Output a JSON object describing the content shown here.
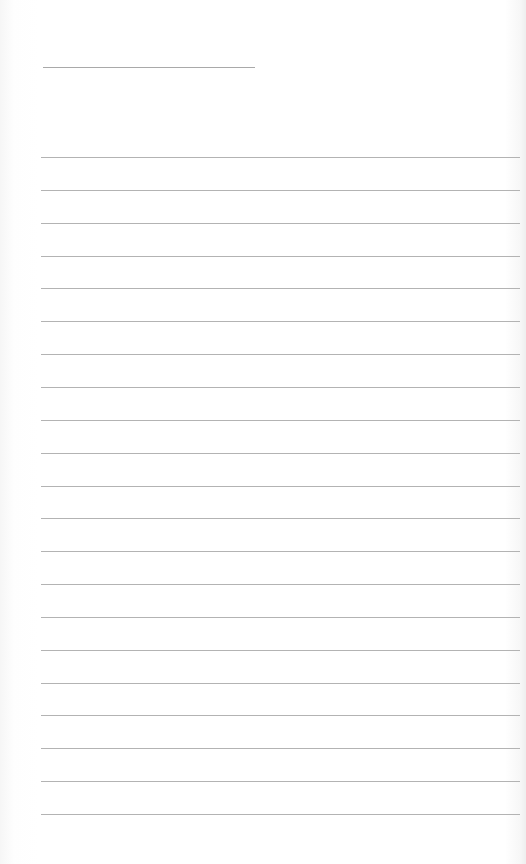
{
  "page": {
    "title": "",
    "line_color": "#b3b3b3",
    "title_line_color": "#a9a9a9",
    "background": "#ffffff"
  },
  "lines": [
    {
      "text": ""
    },
    {
      "text": ""
    },
    {
      "text": ""
    },
    {
      "text": ""
    },
    {
      "text": ""
    },
    {
      "text": ""
    },
    {
      "text": ""
    },
    {
      "text": ""
    },
    {
      "text": ""
    },
    {
      "text": ""
    },
    {
      "text": ""
    },
    {
      "text": ""
    },
    {
      "text": ""
    },
    {
      "text": ""
    },
    {
      "text": ""
    },
    {
      "text": ""
    },
    {
      "text": ""
    },
    {
      "text": ""
    },
    {
      "text": ""
    },
    {
      "text": ""
    },
    {
      "text": ""
    }
  ]
}
